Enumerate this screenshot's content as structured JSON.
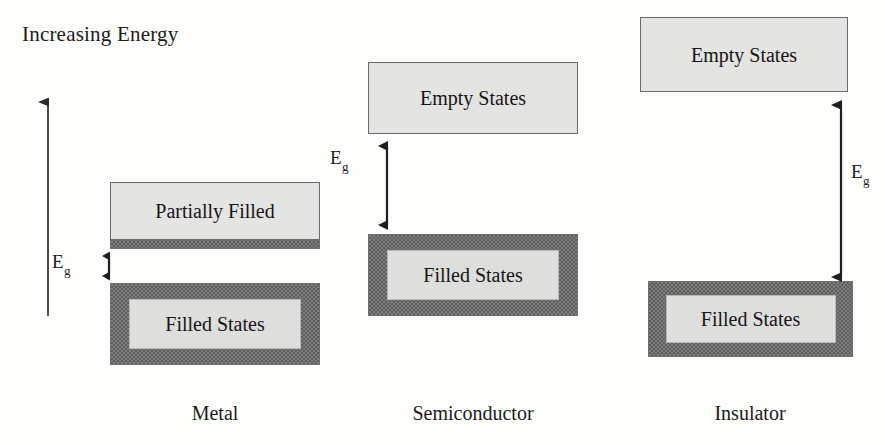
{
  "figure": {
    "axis_label": "Increasing Energy",
    "gap_symbol": "E",
    "gap_subscript": "g",
    "colors": {
      "background": "#fdfdfc",
      "dark_band": "#5f5f5f",
      "light_band": "#e4e4e2",
      "plate": "#dededc",
      "outline": "#6b6b6b",
      "text": "#1b1b1b"
    }
  },
  "columns": [
    {
      "id": "metal",
      "caption": "Metal",
      "bands": [
        {
          "id": "metal-partially-filled",
          "label": "Partially Filled",
          "style": "light"
        },
        {
          "id": "metal-filled",
          "label": "Filled States",
          "style": "dark"
        }
      ],
      "gap": {
        "label_symbol": "E",
        "label_subscript": "g",
        "size": "very small"
      }
    },
    {
      "id": "semiconductor",
      "caption": "Semiconductor",
      "bands": [
        {
          "id": "semiconductor-empty",
          "label": "Empty States",
          "style": "light"
        },
        {
          "id": "semiconductor-filled",
          "label": "Filled States",
          "style": "dark"
        }
      ],
      "gap": {
        "label_symbol": "E",
        "label_subscript": "g",
        "size": "moderate"
      }
    },
    {
      "id": "insulator",
      "caption": "Insulator",
      "bands": [
        {
          "id": "insulator-empty",
          "label": "Empty States",
          "style": "light"
        },
        {
          "id": "insulator-filled",
          "label": "Filled States",
          "style": "dark"
        }
      ],
      "gap": {
        "label_symbol": "E",
        "label_subscript": "g",
        "size": "large"
      }
    }
  ]
}
